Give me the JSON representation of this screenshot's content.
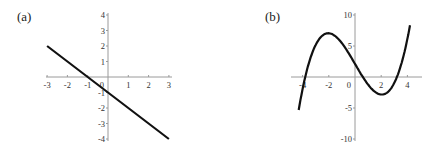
{
  "chart_data": [
    {
      "type": "line",
      "label": "(a)",
      "title": "",
      "xlabel": "",
      "ylabel": "",
      "xlim": [
        -3,
        3
      ],
      "ylim": [
        -4,
        4
      ],
      "xticks": [
        "-3",
        "-2",
        "-1",
        "0",
        "1",
        "2",
        "3"
      ],
      "yticks": [
        "4",
        "3",
        "2",
        "1",
        "-1",
        "-2",
        "-3",
        "-4"
      ],
      "grid": false,
      "series": [
        {
          "name": "y = -x - 1",
          "x": [
            -3,
            -2,
            -1,
            0,
            1,
            2,
            3
          ],
          "y": [
            2,
            1,
            0,
            -1,
            -2,
            -3,
            -4
          ]
        }
      ]
    },
    {
      "type": "line",
      "label": "(b)",
      "title": "",
      "xlabel": "",
      "ylabel": "",
      "xlim": [
        -4.4,
        4.2
      ],
      "ylim": [
        -10,
        10
      ],
      "xticks": [
        "-4",
        "-2",
        "0",
        "2",
        "4"
      ],
      "yticks": [
        "10",
        "5",
        "-5",
        "-10"
      ],
      "grid": false,
      "series": [
        {
          "name": "cubic",
          "x": [
            -4.3,
            -4,
            -3.8,
            -3,
            -2,
            -1,
            0,
            0.6,
            1,
            2,
            3,
            3.2,
            4,
            4.2
          ],
          "y": [
            -10,
            -2.6,
            0,
            5.6,
            7.0,
            5.1,
            2.1,
            0,
            -1.4,
            -2.8,
            -0.8,
            0,
            7.2,
            10
          ]
        }
      ]
    }
  ],
  "panels": {
    "a": {
      "label": "(a)"
    },
    "b": {
      "label": "(b)"
    }
  }
}
